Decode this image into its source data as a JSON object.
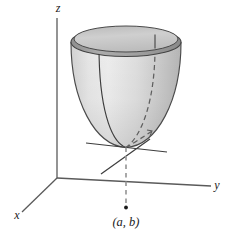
{
  "figure": {
    "kind": "3d-surface-diagram",
    "background_color": "#ffffff"
  },
  "axes": {
    "x": {
      "label": "x",
      "label_x": 17,
      "label_y": 219
    },
    "y": {
      "label": "y",
      "label_x": 217,
      "label_y": 189
    },
    "z": {
      "label": "z",
      "label_x": 58,
      "label_y": 12
    },
    "origin": {
      "x": 57,
      "y": 178
    },
    "line_color": "#5a5a5a"
  },
  "surface": {
    "name": "paraboloid",
    "fill_light": "#ececec",
    "fill_mid": "#d6d6d6",
    "fill_dark": "#b8b8b8",
    "outline_color": "#4a4a4a",
    "rim_fill": "#9e9e9e",
    "rim_inner_fill": "#c9c9c9",
    "vertex": {
      "x": 126,
      "y": 147
    }
  },
  "curves": {
    "front_trace_color": "#3d3d3d",
    "back_trace_color": "#3d3d3d",
    "dashed_trace_color": "#5f5f5f"
  },
  "tangent_lines": {
    "color": "#3d3d3d",
    "count": 2
  },
  "drop_line": {
    "color": "#9a9a9a",
    "style": "dashed",
    "from": {
      "x": 126,
      "y": 147
    },
    "to": {
      "x": 126,
      "y": 208
    }
  },
  "point": {
    "label": "(a, b)",
    "marker_x": 126,
    "marker_y": 208,
    "label_x": 126,
    "label_y": 225,
    "marker_color": "#1a1a1a"
  }
}
